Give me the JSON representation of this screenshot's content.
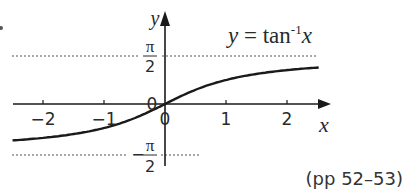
{
  "chart_data": {
    "type": "line",
    "title_parts": {
      "lhs": "y",
      "eq": " = tan",
      "sup": "-1",
      "var": "x"
    },
    "xlabel": "x",
    "ylabel": "y",
    "xlim": [
      -2.5,
      2.6
    ],
    "ylim": [
      -1.9,
      3.0
    ],
    "x_ticks": [
      {
        "value": -2,
        "label": "−2"
      },
      {
        "value": -1,
        "label": "−1"
      },
      {
        "value": 1,
        "label": "1"
      },
      {
        "value": 2,
        "label": "2"
      }
    ],
    "origin_label": "0",
    "origin_label_left": "0",
    "asymptotes": [
      {
        "y": 1.5708,
        "label_num": "π",
        "label_den": "2",
        "sign": ""
      },
      {
        "y": -1.5708,
        "label_num": "π",
        "label_den": "2",
        "sign": "−"
      }
    ],
    "series": [
      {
        "name": "y = tan⁻¹x",
        "x": [
          -2.5,
          -2,
          -1.5,
          -1,
          -0.5,
          0,
          0.5,
          1,
          1.5,
          2,
          2.5
        ],
        "y": [
          -1.19,
          -1.107,
          -0.983,
          -0.785,
          -0.464,
          0,
          0.464,
          0.785,
          0.983,
          1.107,
          1.19
        ]
      }
    ],
    "grid": false,
    "legend": "none"
  },
  "footnote": "(pp 52–53)",
  "colors": {
    "axis": "#1a1a1a",
    "curve": "#1a1a1a",
    "asymptote": "#555555",
    "text": "#2a2a2a"
  }
}
